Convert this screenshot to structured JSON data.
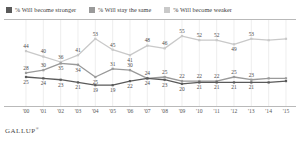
{
  "legend": {
    "items": [
      {
        "label": "% Will become stronger",
        "color": "#5a5a5a",
        "key": "stronger"
      },
      {
        "label": "% Will stay the same",
        "color": "#9a9a9a",
        "key": "same"
      },
      {
        "label": "% Will become weaker",
        "color": "#c9c9c9",
        "key": "weaker"
      }
    ]
  },
  "footer": {
    "brand": "GALLUP",
    "mark": "®"
  },
  "chart_data": {
    "type": "line",
    "title": "",
    "subtitle": "",
    "xlabel": "",
    "ylabel": "",
    "ylim": [
      14,
      58
    ],
    "grid": "vertical",
    "legend_position": "top",
    "categories": [
      "'00",
      "'01",
      "'02",
      "'03",
      "'04",
      "'05",
      "'06",
      "'07",
      "'08",
      "'09",
      "'10",
      "'11",
      "'12",
      "'13",
      "'14",
      "'15"
    ],
    "series": [
      {
        "name": "% Will become weaker",
        "color": "#c9c9c9",
        "values": [
          44,
          40,
          36,
          41,
          53,
          45,
          41,
          48,
          46,
          55,
          52,
          52,
          49,
          53,
          52,
          53
        ],
        "labels": [
          "44",
          "40",
          "36",
          "41",
          "53",
          "45",
          "41",
          "48",
          "46",
          "55",
          "52",
          "52",
          "49",
          "53",
          "",
          ""
        ],
        "label_pos": [
          "above",
          "above",
          "above",
          "above",
          "above",
          "above",
          "below",
          "above",
          "above",
          "above",
          "above",
          "above",
          "below",
          "above",
          "",
          ""
        ]
      },
      {
        "name": "% Will stay the same",
        "color": "#9a9a9a",
        "values": [
          28,
          30,
          35,
          34,
          25,
          31,
          30,
          24,
          25,
          22,
          22,
          22,
          25,
          23,
          24,
          24
        ],
        "labels": [
          "28",
          "30",
          "35",
          "34",
          "25",
          "31",
          "30",
          "24",
          "25",
          "22",
          "22",
          "22",
          "25",
          "23",
          "",
          ""
        ],
        "label_pos": [
          "above",
          "above",
          "below",
          "below",
          "below",
          "above",
          "above",
          "above",
          "above",
          "above",
          "above",
          "above",
          "above",
          "above",
          "",
          ""
        ]
      },
      {
        "name": "% Will become stronger",
        "color": "#5a5a5a",
        "values": [
          25,
          24,
          23,
          21,
          19,
          19,
          22,
          24,
          23,
          20,
          21,
          21,
          21,
          21,
          21,
          22
        ],
        "labels": [
          "25",
          "24",
          "23",
          "21",
          "19",
          "19",
          "22",
          "24",
          "23",
          "20",
          "21",
          "21",
          "21",
          "21",
          "",
          ""
        ],
        "label_pos": [
          "below",
          "below",
          "below",
          "below",
          "below",
          "below",
          "below",
          "below",
          "below",
          "below",
          "below",
          "below",
          "below",
          "below",
          "",
          ""
        ]
      }
    ]
  }
}
